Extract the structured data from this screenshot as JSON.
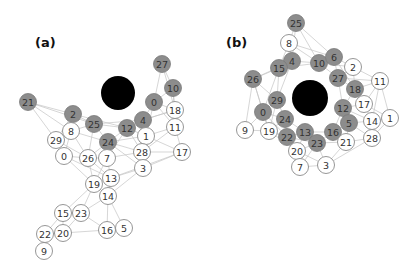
{
  "figure": {
    "panels": [
      {
        "label": "(a)",
        "label_pos": [
          35,
          47
        ],
        "hub": {
          "x": 118,
          "y": 93,
          "r": 17,
          "color": "#000000"
        },
        "nodes": [
          {
            "id": "27",
            "x": 162,
            "y": 64,
            "fill": "gray"
          },
          {
            "id": "10",
            "x": 173,
            "y": 88,
            "fill": "gray"
          },
          {
            "id": "0",
            "x": 154,
            "y": 102,
            "fill": "gray"
          },
          {
            "id": "18",
            "x": 175,
            "y": 110,
            "fill": "white"
          },
          {
            "id": "21",
            "x": 28,
            "y": 102,
            "fill": "gray"
          },
          {
            "id": "2",
            "x": 73,
            "y": 114,
            "fill": "gray"
          },
          {
            "id": "25",
            "x": 94,
            "y": 124,
            "fill": "gray"
          },
          {
            "id": "8",
            "x": 71,
            "y": 131,
            "fill": "white"
          },
          {
            "id": "4",
            "x": 143,
            "y": 120,
            "fill": "gray"
          },
          {
            "id": "12",
            "x": 127,
            "y": 128,
            "fill": "gray"
          },
          {
            "id": "11",
            "x": 175,
            "y": 127,
            "fill": "white"
          },
          {
            "id": "1",
            "x": 146,
            "y": 136,
            "fill": "white"
          },
          {
            "id": "29",
            "x": 56,
            "y": 140,
            "fill": "white"
          },
          {
            "id": "24",
            "x": 108,
            "y": 142,
            "fill": "gray"
          },
          {
            "id": "0w",
            "label": "0",
            "x": 64,
            "y": 156,
            "fill": "white"
          },
          {
            "id": "26",
            "x": 88,
            "y": 158,
            "fill": "white"
          },
          {
            "id": "7",
            "x": 107,
            "y": 158,
            "fill": "white"
          },
          {
            "id": "28",
            "x": 142,
            "y": 152,
            "fill": "white"
          },
          {
            "id": "17",
            "x": 182,
            "y": 152,
            "fill": "white"
          },
          {
            "id": "3",
            "x": 143,
            "y": 168,
            "fill": "white"
          },
          {
            "id": "13",
            "x": 111,
            "y": 178,
            "fill": "white"
          },
          {
            "id": "19",
            "x": 94,
            "y": 184,
            "fill": "white"
          },
          {
            "id": "14",
            "x": 108,
            "y": 196,
            "fill": "white"
          },
          {
            "id": "15",
            "x": 63,
            "y": 213,
            "fill": "white"
          },
          {
            "id": "23",
            "x": 81,
            "y": 213,
            "fill": "white"
          },
          {
            "id": "22",
            "x": 45,
            "y": 234,
            "fill": "white"
          },
          {
            "id": "20",
            "x": 63,
            "y": 233,
            "fill": "white"
          },
          {
            "id": "16",
            "x": 107,
            "y": 230,
            "fill": "white"
          },
          {
            "id": "5",
            "x": 124,
            "y": 228,
            "fill": "white"
          },
          {
            "id": "9",
            "x": 44,
            "y": 251,
            "fill": "white"
          }
        ],
        "edges": [
          [
            "27",
            "10"
          ],
          [
            "27",
            "0"
          ],
          [
            "27",
            "18"
          ],
          [
            "10",
            "0"
          ],
          [
            "10",
            "18"
          ],
          [
            "10",
            "11"
          ],
          [
            "0",
            "18"
          ],
          [
            "0",
            "4"
          ],
          [
            "0",
            "11"
          ],
          [
            "0",
            "1"
          ],
          [
            "18",
            "11"
          ],
          [
            "18",
            "4"
          ],
          [
            "11",
            "17"
          ],
          [
            "11",
            "1"
          ],
          [
            "11",
            "28"
          ],
          [
            "4",
            "12"
          ],
          [
            "4",
            "1"
          ],
          [
            "4",
            "28"
          ],
          [
            "4",
            "18"
          ],
          [
            "12",
            "1"
          ],
          [
            "12",
            "24"
          ],
          [
            "12",
            "25"
          ],
          [
            "12",
            "28"
          ],
          [
            "12",
            "7"
          ],
          [
            "1",
            "28"
          ],
          [
            "1",
            "17"
          ],
          [
            "1",
            "3"
          ],
          [
            "21",
            "2"
          ],
          [
            "21",
            "8"
          ],
          [
            "21",
            "25"
          ],
          [
            "21",
            "29"
          ],
          [
            "2",
            "25"
          ],
          [
            "2",
            "8"
          ],
          [
            "2",
            "29"
          ],
          [
            "2",
            "12"
          ],
          [
            "25",
            "8"
          ],
          [
            "25",
            "24"
          ],
          [
            "25",
            "26"
          ],
          [
            "25",
            "4"
          ],
          [
            "8",
            "29"
          ],
          [
            "8",
            "0w"
          ],
          [
            "8",
            "26"
          ],
          [
            "8",
            "24"
          ],
          [
            "29",
            "0w"
          ],
          [
            "29",
            "26"
          ],
          [
            "24",
            "7"
          ],
          [
            "24",
            "26"
          ],
          [
            "24",
            "28"
          ],
          [
            "24",
            "3"
          ],
          [
            "24",
            "1"
          ],
          [
            "0w",
            "26"
          ],
          [
            "0w",
            "19"
          ],
          [
            "26",
            "7"
          ],
          [
            "26",
            "19"
          ],
          [
            "26",
            "13"
          ],
          [
            "7",
            "13"
          ],
          [
            "7",
            "19"
          ],
          [
            "7",
            "28"
          ],
          [
            "28",
            "3"
          ],
          [
            "28",
            "17"
          ],
          [
            "17",
            "3"
          ],
          [
            "3",
            "13"
          ],
          [
            "3",
            "14"
          ],
          [
            "13",
            "19"
          ],
          [
            "13",
            "14"
          ],
          [
            "19",
            "14"
          ],
          [
            "19",
            "23"
          ],
          [
            "19",
            "15"
          ],
          [
            "14",
            "16"
          ],
          [
            "14",
            "23"
          ],
          [
            "14",
            "5"
          ],
          [
            "23",
            "15"
          ],
          [
            "23",
            "16"
          ],
          [
            "23",
            "20"
          ],
          [
            "15",
            "20"
          ],
          [
            "15",
            "22"
          ],
          [
            "20",
            "22"
          ],
          [
            "20",
            "16"
          ],
          [
            "22",
            "9"
          ],
          [
            "16",
            "5"
          ],
          [
            "13",
            "17"
          ],
          [
            "0w",
            "13"
          ]
        ]
      },
      {
        "label": "(b)",
        "label_pos": [
          226,
          47
        ],
        "hub": {
          "x": 310,
          "y": 98,
          "r": 18,
          "color": "#000000"
        },
        "nodes": [
          {
            "id": "25",
            "x": 296,
            "y": 23,
            "fill": "gray"
          },
          {
            "id": "8",
            "x": 289,
            "y": 43,
            "fill": "white"
          },
          {
            "id": "4",
            "x": 292,
            "y": 61,
            "fill": "gray"
          },
          {
            "id": "15",
            "x": 279,
            "y": 68,
            "fill": "gray"
          },
          {
            "id": "10",
            "x": 319,
            "y": 63,
            "fill": "gray"
          },
          {
            "id": "6",
            "x": 334,
            "y": 57,
            "fill": "gray"
          },
          {
            "id": "2",
            "x": 353,
            "y": 67,
            "fill": "white"
          },
          {
            "id": "26",
            "x": 253,
            "y": 79,
            "fill": "gray"
          },
          {
            "id": "27",
            "x": 338,
            "y": 78,
            "fill": "gray"
          },
          {
            "id": "11",
            "x": 380,
            "y": 81,
            "fill": "white"
          },
          {
            "id": "18",
            "x": 355,
            "y": 89,
            "fill": "gray"
          },
          {
            "id": "29",
            "x": 277,
            "y": 100,
            "fill": "gray"
          },
          {
            "id": "12",
            "x": 343,
            "y": 108,
            "fill": "gray"
          },
          {
            "id": "17",
            "x": 364,
            "y": 104,
            "fill": "white"
          },
          {
            "id": "0",
            "x": 263,
            "y": 112,
            "fill": "gray"
          },
          {
            "id": "24",
            "x": 285,
            "y": 119,
            "fill": "gray"
          },
          {
            "id": "5",
            "x": 349,
            "y": 123,
            "fill": "gray"
          },
          {
            "id": "14",
            "x": 372,
            "y": 121,
            "fill": "white"
          },
          {
            "id": "1",
            "x": 390,
            "y": 118,
            "fill": "white"
          },
          {
            "id": "9",
            "x": 245,
            "y": 130,
            "fill": "white"
          },
          {
            "id": "19",
            "x": 269,
            "y": 131,
            "fill": "white"
          },
          {
            "id": "22",
            "x": 287,
            "y": 137,
            "fill": "gray"
          },
          {
            "id": "13",
            "x": 305,
            "y": 132,
            "fill": "gray"
          },
          {
            "id": "16",
            "x": 333,
            "y": 132,
            "fill": "gray"
          },
          {
            "id": "28",
            "x": 372,
            "y": 138,
            "fill": "white"
          },
          {
            "id": "23",
            "x": 317,
            "y": 143,
            "fill": "gray"
          },
          {
            "id": "21",
            "x": 346,
            "y": 142,
            "fill": "white"
          },
          {
            "id": "20",
            "x": 297,
            "y": 151,
            "fill": "white"
          },
          {
            "id": "7",
            "x": 300,
            "y": 167,
            "fill": "white"
          },
          {
            "id": "3",
            "x": 326,
            "y": 165,
            "fill": "white"
          }
        ],
        "edges": [
          [
            "25",
            "8"
          ],
          [
            "25",
            "4"
          ],
          [
            "25",
            "10"
          ],
          [
            "25",
            "6"
          ],
          [
            "8",
            "4"
          ],
          [
            "8",
            "15"
          ],
          [
            "8",
            "10"
          ],
          [
            "8",
            "6"
          ],
          [
            "4",
            "15"
          ],
          [
            "4",
            "10"
          ],
          [
            "4",
            "26"
          ],
          [
            "4",
            "29"
          ],
          [
            "15",
            "26"
          ],
          [
            "15",
            "29"
          ],
          [
            "15",
            "0"
          ],
          [
            "15",
            "10"
          ],
          [
            "10",
            "6"
          ],
          [
            "10",
            "27"
          ],
          [
            "10",
            "2"
          ],
          [
            "6",
            "2"
          ],
          [
            "6",
            "27"
          ],
          [
            "6",
            "18"
          ],
          [
            "2",
            "27"
          ],
          [
            "2",
            "11"
          ],
          [
            "2",
            "18"
          ],
          [
            "27",
            "18"
          ],
          [
            "27",
            "12"
          ],
          [
            "27",
            "11"
          ],
          [
            "18",
            "11"
          ],
          [
            "18",
            "12"
          ],
          [
            "18",
            "17"
          ],
          [
            "11",
            "17"
          ],
          [
            "11",
            "1"
          ],
          [
            "11",
            "14"
          ],
          [
            "26",
            "29"
          ],
          [
            "26",
            "0"
          ],
          [
            "26",
            "9"
          ],
          [
            "26",
            "19"
          ],
          [
            "29",
            "0"
          ],
          [
            "29",
            "24"
          ],
          [
            "29",
            "19"
          ],
          [
            "0",
            "24"
          ],
          [
            "0",
            "9"
          ],
          [
            "0",
            "19"
          ],
          [
            "0",
            "22"
          ],
          [
            "24",
            "22"
          ],
          [
            "24",
            "13"
          ],
          [
            "24",
            "19"
          ],
          [
            "12",
            "17"
          ],
          [
            "12",
            "5"
          ],
          [
            "12",
            "16"
          ],
          [
            "12",
            "14"
          ],
          [
            "17",
            "14"
          ],
          [
            "17",
            "1"
          ],
          [
            "5",
            "14"
          ],
          [
            "5",
            "16"
          ],
          [
            "5",
            "21"
          ],
          [
            "5",
            "28"
          ],
          [
            "14",
            "1"
          ],
          [
            "14",
            "28"
          ],
          [
            "1",
            "28"
          ],
          [
            "9",
            "19"
          ],
          [
            "19",
            "22"
          ],
          [
            "19",
            "20"
          ],
          [
            "22",
            "13"
          ],
          [
            "22",
            "20"
          ],
          [
            "22",
            "23"
          ],
          [
            "13",
            "16"
          ],
          [
            "13",
            "23"
          ],
          [
            "13",
            "20"
          ],
          [
            "16",
            "23"
          ],
          [
            "16",
            "21"
          ],
          [
            "16",
            "5"
          ],
          [
            "23",
            "21"
          ],
          [
            "23",
            "3"
          ],
          [
            "23",
            "20"
          ],
          [
            "21",
            "28"
          ],
          [
            "21",
            "3"
          ],
          [
            "20",
            "7"
          ],
          [
            "20",
            "3"
          ],
          [
            "7",
            "3"
          ],
          [
            "7",
            "23"
          ],
          [
            "28",
            "3"
          ]
        ]
      }
    ],
    "colors": {
      "gray_node": "#8c8c8c",
      "white_node": "#ffffff",
      "node_stroke": "#8a8a8a",
      "edge": "#c4c4c4",
      "hub": "#000000"
    }
  }
}
